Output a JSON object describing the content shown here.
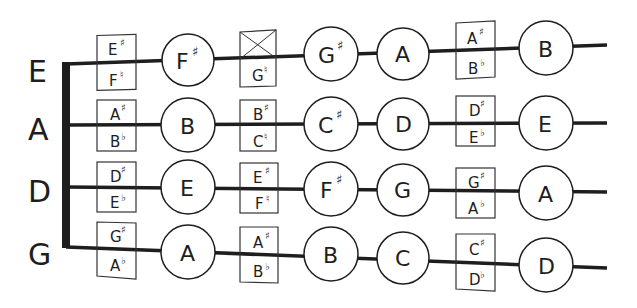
{
  "diagram": {
    "type": "violin-fingerboard-note-chart",
    "colors": {
      "ink": "#1e1e1e",
      "background": "#ffffff"
    },
    "strings": [
      {
        "name": "E",
        "positions": [
          {
            "kind": "box",
            "top": "E",
            "top_acc": "♯",
            "bottom": "F",
            "bottom_acc": "♮"
          },
          {
            "kind": "circle",
            "note": "F",
            "acc": "♯"
          },
          {
            "kind": "box",
            "top": "",
            "top_acc": "",
            "top_crossed": true,
            "bottom": "G",
            "bottom_acc": "♮"
          },
          {
            "kind": "circle",
            "note": "G",
            "acc": "♯"
          },
          {
            "kind": "circle",
            "note": "A",
            "acc": ""
          },
          {
            "kind": "box",
            "top": "A",
            "top_acc": "♯",
            "bottom": "B",
            "bottom_acc": "♭"
          },
          {
            "kind": "circle",
            "note": "B",
            "acc": ""
          }
        ]
      },
      {
        "name": "A",
        "positions": [
          {
            "kind": "box",
            "top": "A",
            "top_acc": "♯",
            "bottom": "B",
            "bottom_acc": "♭"
          },
          {
            "kind": "circle",
            "note": "B",
            "acc": ""
          },
          {
            "kind": "box",
            "top": "B",
            "top_acc": "♯",
            "bottom": "C",
            "bottom_acc": "♮"
          },
          {
            "kind": "circle",
            "note": "C",
            "acc": "♯"
          },
          {
            "kind": "circle",
            "note": "D",
            "acc": ""
          },
          {
            "kind": "box",
            "top": "D",
            "top_acc": "♯",
            "bottom": "E",
            "bottom_acc": "♭"
          },
          {
            "kind": "circle",
            "note": "E",
            "acc": ""
          }
        ]
      },
      {
        "name": "D",
        "positions": [
          {
            "kind": "box",
            "top": "D",
            "top_acc": "♯",
            "bottom": "E",
            "bottom_acc": "♭"
          },
          {
            "kind": "circle",
            "note": "E",
            "acc": ""
          },
          {
            "kind": "box",
            "top": "E",
            "top_acc": "♯",
            "bottom": "F",
            "bottom_acc": "♮"
          },
          {
            "kind": "circle",
            "note": "F",
            "acc": "♯"
          },
          {
            "kind": "circle",
            "note": "G",
            "acc": ""
          },
          {
            "kind": "box",
            "top": "G",
            "top_acc": "♯",
            "bottom": "A",
            "bottom_acc": "♭"
          },
          {
            "kind": "circle",
            "note": "A",
            "acc": ""
          }
        ]
      },
      {
        "name": "G",
        "positions": [
          {
            "kind": "box",
            "top": "G",
            "top_acc": "♯",
            "bottom": "A",
            "bottom_acc": "♭"
          },
          {
            "kind": "circle",
            "note": "A",
            "acc": ""
          },
          {
            "kind": "box",
            "top": "A",
            "top_acc": "♯",
            "bottom": "B",
            "bottom_acc": "♭"
          },
          {
            "kind": "circle",
            "note": "B",
            "acc": ""
          },
          {
            "kind": "circle",
            "note": "C",
            "acc": ""
          },
          {
            "kind": "box",
            "top": "C",
            "top_acc": "♯",
            "bottom": "D",
            "bottom_acc": "♭"
          },
          {
            "kind": "circle",
            "note": "D",
            "acc": ""
          }
        ]
      }
    ]
  }
}
